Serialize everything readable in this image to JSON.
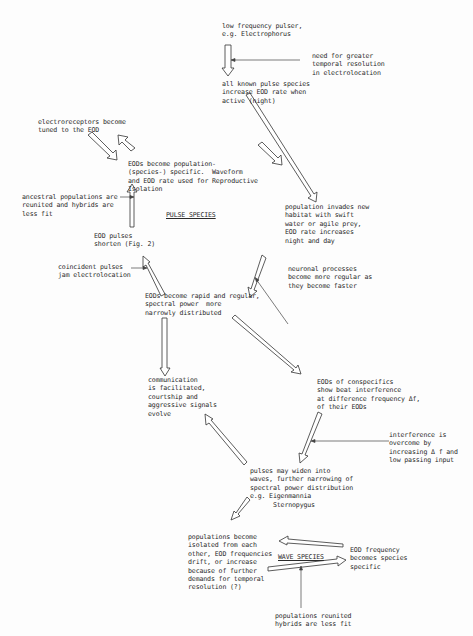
{
  "diagram": {
    "labels": {
      "pulse_species": "PULSE SPECIES",
      "wave_species": "WAVE SPECIES"
    },
    "nodes": [
      {
        "id": "n1",
        "text": "low frequency pulser,\ne.g. Electrophorus"
      },
      {
        "id": "n2",
        "text": "need for greater\ntemporal resolution\nin electrolocation"
      },
      {
        "id": "n3",
        "text": "all known pulse species\nincrease EOD rate when\nactive (night)"
      },
      {
        "id": "n4",
        "text": "electroreceptors become\ntuned to the EOD"
      },
      {
        "id": "n5",
        "text": "EODs become population-\n(species-) specific.  Waveform\nand EOD rate used for Reproductive\nIsolation"
      },
      {
        "id": "n6",
        "text": "ancestral populations are\nreunited and hybrids are\nless fit"
      },
      {
        "id": "n7",
        "text": "population invades new\nhabitat with swift\nwater or agile prey,\nEOD rate increases\nnight and day"
      },
      {
        "id": "n8",
        "text": "EOD pulses\nshorten (Fig. 2)"
      },
      {
        "id": "n9",
        "text": "coincident pulses\njam electrolocation"
      },
      {
        "id": "n10",
        "text": "neuronal processes\nbecome more regular as\nthey become faster"
      },
      {
        "id": "n11",
        "text": "EODs become rapid and regular,\nspectral power  more\nnarrowly distributed"
      },
      {
        "id": "n12",
        "text": "communication\nis facilitated,\ncourtship and\naggressive signals\nevolve"
      },
      {
        "id": "n13",
        "text": "EODs of conspecifics\nshow beat interference\nat difference frequency Δf,\nof their EODs"
      },
      {
        "id": "n14",
        "text": "interference is\novercome by\nincreasing Δ f and\nlow passing input"
      },
      {
        "id": "n15",
        "text": "pulses may widen into\nwaves, further narrowing of\nspectral power distribution\ne.g. Eigenmannia\n      Sternopygus"
      },
      {
        "id": "n16",
        "text": "populations become\nisolated from each\nother, EOD frequencies\ndrift, or increase\nbecause of further\ndemands for temporal\nresolution (?)"
      },
      {
        "id": "n17",
        "text": "EOD frequency\nbecomes species\nspecific"
      },
      {
        "id": "n18",
        "text": "populations reunited\nhybrids are less fit"
      }
    ]
  }
}
